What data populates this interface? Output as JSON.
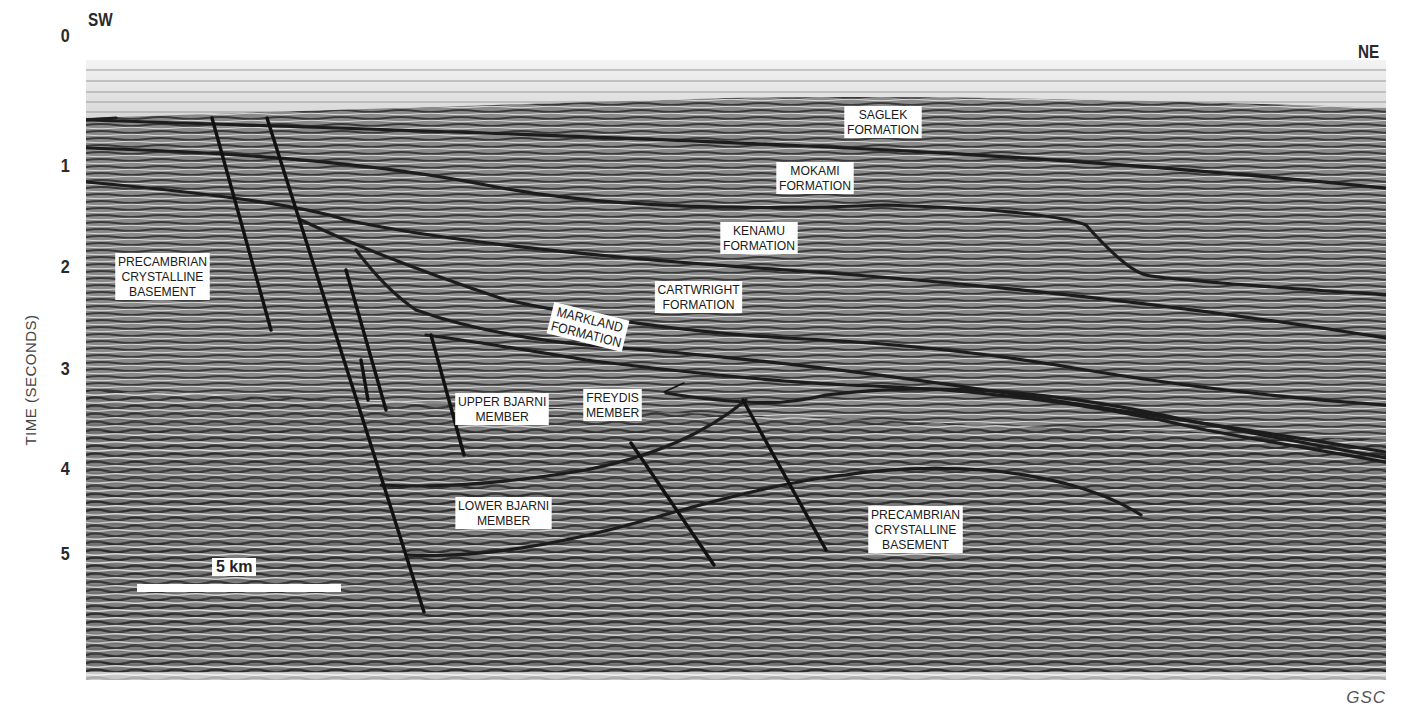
{
  "figure": {
    "type": "seismic-section",
    "orientation": {
      "left": "SW",
      "right": "NE"
    },
    "y_axis": {
      "label": "TIME (SECONDS)",
      "ticks": [
        {
          "label": "0",
          "y": 37
        },
        {
          "label": "1",
          "y": 167
        },
        {
          "label": "2",
          "y": 268
        },
        {
          "label": "3",
          "y": 370
        },
        {
          "label": "4",
          "y": 470
        },
        {
          "label": "5",
          "y": 555
        }
      ]
    },
    "labels": [
      {
        "id": "saglek",
        "lines": [
          "SAGLEK",
          "FORMATION"
        ],
        "x": 855,
        "y": 110
      },
      {
        "id": "mokami",
        "lines": [
          "MOKAMI",
          "FORMATION"
        ],
        "x": 780,
        "y": 163
      },
      {
        "id": "kenamu",
        "lines": [
          "KENAMU",
          "FORMATION"
        ],
        "x": 720,
        "y": 220
      },
      {
        "id": "cartwright",
        "lines": [
          "CARTWRIGHT",
          "FORMATION"
        ],
        "x": 652,
        "y": 280
      },
      {
        "id": "markland",
        "lines": [
          "MARKLAND",
          "FORMATION"
        ],
        "x": 548,
        "y": 305,
        "rotate": 14
      },
      {
        "id": "upper-bjarni",
        "lines": [
          "UPPER BJARNI",
          "MEMBER"
        ],
        "x": 455,
        "y": 393
      },
      {
        "id": "freydis",
        "lines": [
          "FREYDIS",
          "MEMBER"
        ],
        "x": 583,
        "y": 389
      },
      {
        "id": "lower-bjarni",
        "lines": [
          "LOWER BJARNI",
          "MEMBER"
        ],
        "x": 452,
        "y": 497
      },
      {
        "id": "basement-west",
        "lines": [
          "PRECAMBRIAN",
          "CRYSTALLINE",
          "BASEMENT"
        ],
        "x": 112,
        "y": 253
      },
      {
        "id": "basement-east",
        "lines": [
          "PRECAMBRIAN",
          "CRYSTALLINE",
          "BASEMENT"
        ],
        "x": 864,
        "y": 505
      }
    ],
    "scale_bar": {
      "label": "5 km"
    },
    "credit": "GSC"
  }
}
